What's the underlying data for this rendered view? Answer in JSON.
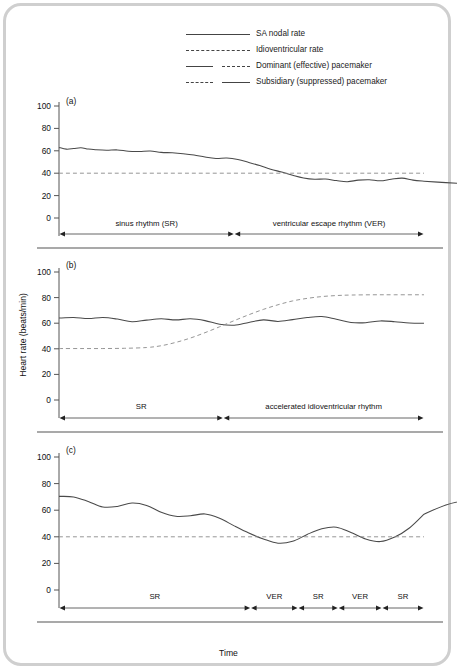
{
  "figure": {
    "ylabel": "Heart rate (beats/min)",
    "xlabel": "Time",
    "legend": [
      {
        "label": "SA nodal rate",
        "key": "solid-full"
      },
      {
        "label": "Idioventricular rate",
        "key": "dashed-full"
      },
      {
        "label": "Dominant (effective) pacemaker",
        "key": "solid-then-dashed"
      },
      {
        "label": "Subsidiary (suppressed) pacemaker",
        "key": "dashed-then-solid"
      }
    ]
  },
  "chart_data": [
    {
      "type": "line",
      "panel": "(a)",
      "title": "",
      "xlabel": "",
      "ylabel": "Heart rate (beats/min)",
      "ylim": [
        0,
        100
      ],
      "yticks": [
        0,
        20,
        40,
        60,
        80,
        100
      ],
      "xlim": [
        0,
        100
      ],
      "grid": false,
      "legend_position": "top",
      "series": [
        {
          "name": "SA nodal rate",
          "style": "solid",
          "x": [
            0,
            2,
            4,
            6,
            8,
            10,
            13,
            16,
            19,
            22,
            25,
            28,
            31,
            34,
            37,
            40,
            43,
            46,
            49,
            52,
            55,
            58,
            61,
            64,
            67,
            70,
            73,
            76,
            79,
            82,
            85,
            88,
            91,
            94,
            97,
            100
          ],
          "y": [
            63,
            61.5,
            62,
            62.8,
            61.6,
            61,
            60.5,
            60.8,
            59.6,
            59.4,
            59.8,
            58.6,
            58.2,
            57.4,
            56.2,
            54.4,
            53.2,
            53.5,
            52.2,
            49.6,
            46.8,
            43.6,
            41.0,
            38.2,
            35.8,
            34.6,
            34.8,
            33.4,
            32.4,
            33.8,
            34.2,
            33.2,
            34.6,
            35.6,
            33.8,
            32.8
          ]
        },
        {
          "name": "Idioventricular rate",
          "style": "dashed",
          "x": [
            0,
            100
          ],
          "y": [
            40,
            40
          ]
        }
      ],
      "tail": {
        "name": "SA nodal rate (tail)",
        "x": [
          100,
          106,
          112,
          118,
          124,
          130
        ],
        "y": [
          32.8,
          31.6,
          30.6,
          29.8,
          29.2,
          29.0
        ]
      },
      "segments": [
        {
          "label": "sinus rhythm (SR)",
          "start": 0,
          "end": 48
        },
        {
          "label": "ventricular escape rhythm (VER)",
          "start": 48,
          "end": 100
        }
      ]
    },
    {
      "type": "line",
      "panel": "(b)",
      "title": "",
      "xlabel": "",
      "ylabel": "Heart rate (beats/min)",
      "ylim": [
        0,
        100
      ],
      "yticks": [
        0,
        20,
        40,
        60,
        80,
        100
      ],
      "xlim": [
        0,
        100
      ],
      "grid": false,
      "legend_position": "top",
      "series": [
        {
          "name": "SA nodal rate",
          "style": "solid",
          "x": [
            0,
            4,
            8,
            12,
            16,
            20,
            24,
            28,
            32,
            36,
            40,
            44,
            48,
            52,
            56,
            60,
            64,
            68,
            72,
            76,
            80,
            84,
            88,
            92,
            96,
            100
          ],
          "y": [
            64,
            64.5,
            63.6,
            64.4,
            63.2,
            61.2,
            62.4,
            63.4,
            62.6,
            63.4,
            62.0,
            59.2,
            58.4,
            60.6,
            62.6,
            61.4,
            62.8,
            64.4,
            65.2,
            63.0,
            60.6,
            60.4,
            61.8,
            61.2,
            60.2,
            60.0
          ]
        },
        {
          "name": "Idioventricular rate",
          "style": "dashed",
          "x": [
            0,
            6,
            12,
            18,
            24,
            28,
            32,
            36,
            40,
            44,
            48,
            52,
            56,
            60,
            64,
            68,
            72,
            76,
            80,
            86,
            92,
            100
          ],
          "y": [
            40.2,
            40.2,
            40.2,
            40.4,
            41.0,
            42.4,
            45.0,
            48.4,
            52.6,
            57.2,
            62.0,
            66.6,
            70.8,
            74.4,
            77.4,
            79.4,
            80.8,
            81.6,
            82.0,
            82.2,
            82.2,
            82.2
          ]
        }
      ],
      "segments": [
        {
          "label": "SR",
          "start": 0,
          "end": 45
        },
        {
          "label": "accelerated idioventricular rhythm",
          "start": 45,
          "end": 100
        }
      ]
    },
    {
      "type": "line",
      "panel": "(c)",
      "title": "",
      "xlabel": "Time",
      "ylabel": "Heart rate (beats/min)",
      "ylim": [
        0,
        100
      ],
      "yticks": [
        0,
        20,
        40,
        60,
        80,
        100
      ],
      "xlim": [
        0,
        100
      ],
      "grid": false,
      "legend_position": "top",
      "series": [
        {
          "name": "SA nodal rate",
          "style": "solid",
          "x": [
            0,
            4,
            8,
            12,
            16,
            20,
            24,
            28,
            32,
            36,
            40,
            44,
            48,
            52,
            56,
            60,
            64,
            68,
            72,
            76,
            80,
            84,
            88,
            92,
            96,
            100
          ],
          "y": [
            70.4,
            70.0,
            66.6,
            62.4,
            62.8,
            65.4,
            63.6,
            58.4,
            55.4,
            55.8,
            57.2,
            54.0,
            48.2,
            42.8,
            38.4,
            35.2,
            36.6,
            41.8,
            46.0,
            47.2,
            43.2,
            38.4,
            36.4,
            39.8,
            46.6,
            57.0
          ]
        },
        {
          "name": "Idioventricular rate",
          "style": "dashed",
          "x": [
            0,
            100
          ],
          "y": [
            40,
            40
          ]
        }
      ],
      "tail": {
        "name": "SA nodal rate (tail)",
        "x": [
          100,
          106,
          112,
          118,
          124,
          130
        ],
        "y": [
          57.0,
          64.0,
          67.6,
          68.6,
          68.4,
          67.6
        ]
      },
      "segments": [
        {
          "label": "SR",
          "start": 0,
          "end": 52.5
        },
        {
          "label": "VER",
          "start": 52.5,
          "end": 65.5
        },
        {
          "label": "SR",
          "start": 65.5,
          "end": 76.5
        },
        {
          "label": "VER",
          "start": 76.5,
          "end": 88.5
        },
        {
          "label": "SR",
          "start": 88.5,
          "end": 100
        }
      ]
    }
  ]
}
